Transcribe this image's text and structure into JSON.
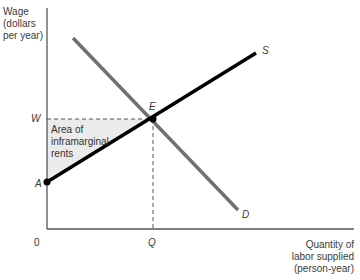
{
  "diagram": {
    "type": "labor supply and demand diagram",
    "y_axis_label": [
      "Wage",
      "(dollars",
      "per year)"
    ],
    "x_axis_label": [
      "Quantity of",
      "labor supplied",
      "(person-year)"
    ],
    "origin_label": "0",
    "wage_label": "W",
    "quantity_label": "Q",
    "equilibrium_label": "E",
    "intercept_label": "A",
    "supply_label": "S",
    "demand_label": "D",
    "shaded_region_label": [
      "Area of",
      "inframarginal",
      "rents"
    ],
    "colors": {
      "supply_line": "#000000",
      "demand_line": "#707070",
      "axes": "#555555",
      "shaded_fill": "#ebebeb",
      "dashed_lines": "#555555"
    }
  }
}
